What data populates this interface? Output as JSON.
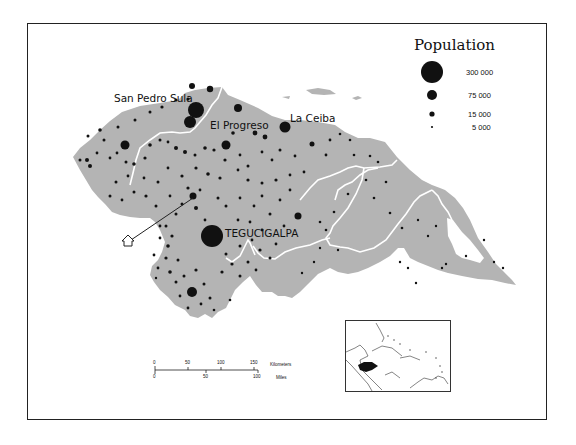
{
  "legend": {
    "title": "Population",
    "items": [
      {
        "label": "300 000",
        "radius": 10
      },
      {
        "label": "75 000",
        "radius": 5.5
      },
      {
        "label": "15 000",
        "radius": 3
      },
      {
        "label": "5 000",
        "radius": 1.2
      }
    ]
  },
  "cities": {
    "san_pedro_sula": "San Pedro Sula",
    "el_progreso": "El Progreso",
    "la_ceiba": "La Ceiba",
    "tegucigalpa": "TEGUCIGALPA"
  },
  "scale_bar": {
    "km_ticks": [
      "0",
      "50",
      "100",
      "150"
    ],
    "km_label": "Kilometers",
    "mile_ticks": [
      "0",
      "50",
      "100"
    ],
    "mile_label": "Miles"
  },
  "inset": {
    "highlight": "Honduras"
  },
  "colors": {
    "land": "#b4b4b4",
    "boundary": "#ffffff",
    "dot": "#111111",
    "frame": "#222222"
  }
}
